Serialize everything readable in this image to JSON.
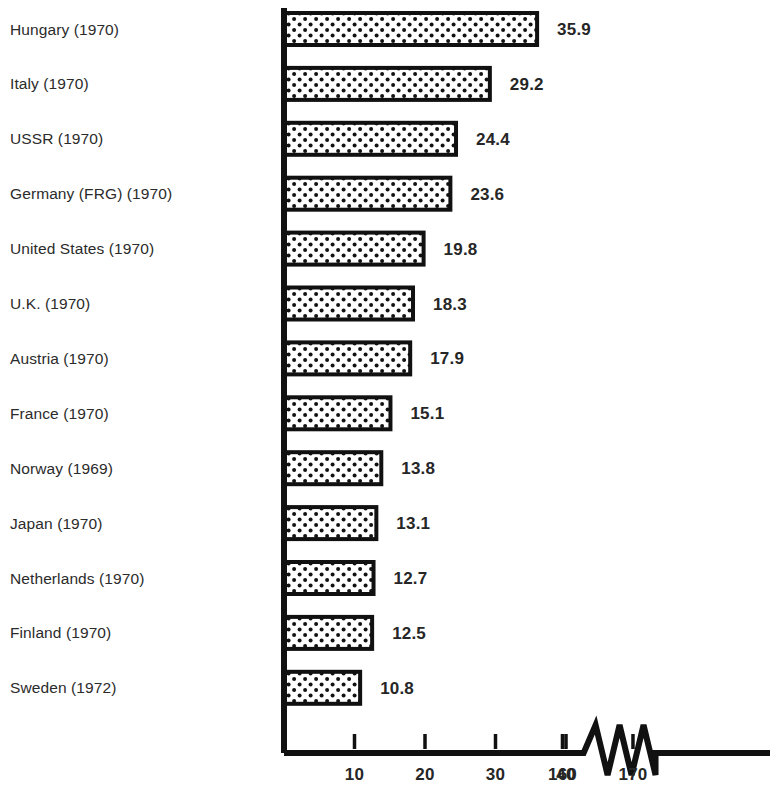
{
  "chart_data": {
    "type": "bar",
    "orientation": "horizontal",
    "title": "",
    "subtitle": "",
    "xlabel": "",
    "ylabel": "",
    "grid": false,
    "legend": null,
    "axis_break": {
      "present": true,
      "style": "zigzag",
      "between": [
        45,
        155
      ]
    },
    "xticks": [
      10,
      20,
      30,
      40,
      160,
      170
    ],
    "xtick_labels": [
      "10",
      "20",
      "30",
      "40",
      "160",
      "170"
    ],
    "xlim": [
      0,
      175
    ],
    "categories": [
      "Hungary (1970)",
      "Italy (1970)",
      "USSR (1970)",
      "Germany (FRG) (1970)",
      "United States (1970)",
      "U.K. (1970)",
      "Austria (1970)",
      "France (1970)",
      "Norway (1969)",
      "Japan (1970)",
      "Netherlands (1970)",
      "Finland (1970)",
      "Sweden (1972)"
    ],
    "values": [
      35.9,
      29.2,
      24.4,
      23.6,
      19.8,
      18.3,
      17.9,
      15.1,
      13.8,
      13.1,
      12.7,
      12.5,
      10.8
    ],
    "value_labels": [
      "35.9",
      "29.2",
      "24.4",
      "23.6",
      "19.8",
      "18.3",
      "17.9",
      "15.1",
      "13.8",
      "13.1",
      "12.7",
      "12.5",
      "10.8"
    ],
    "bar_fill_pattern": "dotted-stipple",
    "colors": {
      "bar_fill": "#ffffff",
      "bar_pattern_dot": "#111111",
      "bar_border": "#111111",
      "axis": "#111111",
      "text": "#262626",
      "background": "#ffffff"
    }
  }
}
